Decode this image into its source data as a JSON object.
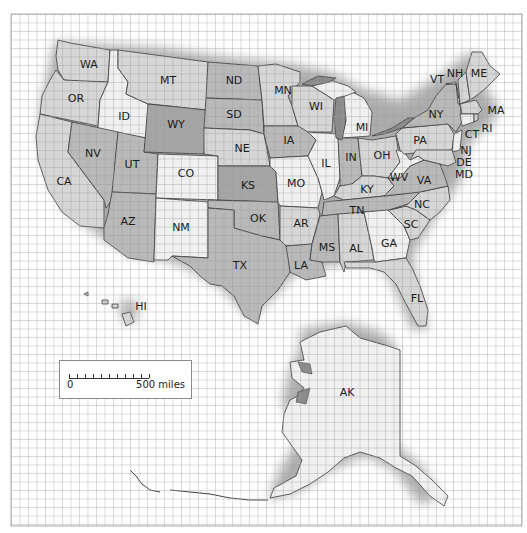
{
  "map": {
    "title": "United States",
    "grid": {
      "x0": 11,
      "y0": 14,
      "x1": 522,
      "y1": 526,
      "cell": 8.5,
      "color": "#9a9a9a"
    },
    "colors": {
      "background": "#ffffff",
      "shade_light": "#f0f0f0",
      "shade_mid": "#d6d6d6",
      "shade_dark": "#b9b9b9",
      "shade_darker": "#a5a5a5",
      "water": "#8a8a8a",
      "border": "#3a3a3a"
    },
    "states": [
      {
        "abbr": "WA",
        "x": 89,
        "y": 65,
        "shade": "shade_mid"
      },
      {
        "abbr": "OR",
        "x": 76,
        "y": 99,
        "shade": "shade_mid"
      },
      {
        "abbr": "CA",
        "x": 64,
        "y": 182,
        "shade": "shade_mid"
      },
      {
        "abbr": "ID",
        "x": 124,
        "y": 117,
        "shade": "shade_light"
      },
      {
        "abbr": "NV",
        "x": 93,
        "y": 154,
        "shade": "shade_dark"
      },
      {
        "abbr": "UT",
        "x": 132,
        "y": 165,
        "shade": "shade_dark"
      },
      {
        "abbr": "AZ",
        "x": 128,
        "y": 222,
        "shade": "shade_dark"
      },
      {
        "abbr": "MT",
        "x": 168,
        "y": 81,
        "shade": "shade_mid"
      },
      {
        "abbr": "WY",
        "x": 176,
        "y": 125,
        "shade": "shade_darker"
      },
      {
        "abbr": "CO",
        "x": 186,
        "y": 174,
        "shade": "shade_light"
      },
      {
        "abbr": "NM",
        "x": 181,
        "y": 228,
        "shade": "shade_light"
      },
      {
        "abbr": "ND",
        "x": 234,
        "y": 81,
        "shade": "shade_dark"
      },
      {
        "abbr": "SD",
        "x": 234,
        "y": 115,
        "shade": "shade_dark"
      },
      {
        "abbr": "NE",
        "x": 242,
        "y": 149,
        "shade": "shade_mid"
      },
      {
        "abbr": "KS",
        "x": 248,
        "y": 186,
        "shade": "shade_darker"
      },
      {
        "abbr": "OK",
        "x": 258,
        "y": 219,
        "shade": "shade_dark"
      },
      {
        "abbr": "TX",
        "x": 240,
        "y": 266,
        "shade": "shade_dark"
      },
      {
        "abbr": "MN",
        "x": 283,
        "y": 91,
        "shade": "shade_mid"
      },
      {
        "abbr": "IA",
        "x": 289,
        "y": 141,
        "shade": "shade_dark"
      },
      {
        "abbr": "MO",
        "x": 296,
        "y": 184,
        "shade": "shade_light"
      },
      {
        "abbr": "AR",
        "x": 301,
        "y": 224,
        "shade": "shade_mid"
      },
      {
        "abbr": "LA",
        "x": 301,
        "y": 266,
        "shade": "shade_dark"
      },
      {
        "abbr": "WI",
        "x": 316,
        "y": 107,
        "shade": "shade_mid"
      },
      {
        "abbr": "IL",
        "x": 326,
        "y": 164,
        "shade": "shade_light"
      },
      {
        "abbr": "MI",
        "x": 362,
        "y": 128,
        "shade": "shade_light"
      },
      {
        "abbr": "IN",
        "x": 351,
        "y": 158,
        "shade": "shade_dark"
      },
      {
        "abbr": "OH",
        "x": 382,
        "y": 156,
        "shade": "shade_mid"
      },
      {
        "abbr": "KY",
        "x": 367,
        "y": 190,
        "shade": "shade_mid"
      },
      {
        "abbr": "TN",
        "x": 357,
        "y": 211,
        "shade": "shade_dark"
      },
      {
        "abbr": "MS",
        "x": 327,
        "y": 248,
        "shade": "shade_dark"
      },
      {
        "abbr": "AL",
        "x": 356,
        "y": 249,
        "shade": "shade_mid"
      },
      {
        "abbr": "GA",
        "x": 389,
        "y": 244,
        "shade": "shade_light"
      },
      {
        "abbr": "FL",
        "x": 417,
        "y": 299,
        "shade": "shade_mid"
      },
      {
        "abbr": "SC",
        "x": 411,
        "y": 225,
        "shade": "shade_mid"
      },
      {
        "abbr": "NC",
        "x": 422,
        "y": 205,
        "shade": "shade_mid"
      },
      {
        "abbr": "VA",
        "x": 424,
        "y": 181,
        "shade": "shade_dark"
      },
      {
        "abbr": "WV",
        "x": 399,
        "y": 178,
        "shade": "shade_light"
      },
      {
        "abbr": "PA",
        "x": 420,
        "y": 141,
        "shade": "shade_mid"
      },
      {
        "abbr": "NY",
        "x": 436,
        "y": 115,
        "shade": "shade_dark"
      },
      {
        "abbr": "VT",
        "x": 437,
        "y": 80,
        "shade": "shade_mid"
      },
      {
        "abbr": "NH",
        "x": 455,
        "y": 74,
        "shade": "shade_mid"
      },
      {
        "abbr": "ME",
        "x": 479,
        "y": 74,
        "shade": "shade_mid"
      },
      {
        "abbr": "MA",
        "x": 496,
        "y": 111,
        "shade": "shade_mid"
      },
      {
        "abbr": "RI",
        "x": 487,
        "y": 129,
        "shade": "shade_mid"
      },
      {
        "abbr": "CT",
        "x": 472,
        "y": 135,
        "shade": "shade_mid"
      },
      {
        "abbr": "NJ",
        "x": 466,
        "y": 151,
        "shade": "shade_mid"
      },
      {
        "abbr": "DE",
        "x": 464,
        "y": 163,
        "shade": "shade_mid"
      },
      {
        "abbr": "MD",
        "x": 464,
        "y": 175,
        "shade": "shade_mid"
      },
      {
        "abbr": "HI",
        "x": 141,
        "y": 307,
        "shade": "shade_mid"
      },
      {
        "abbr": "AK",
        "x": 347,
        "y": 393,
        "shade": "shade_light"
      }
    ],
    "scale": {
      "zero_label": "0",
      "max_label": "500 miles",
      "ticks": 11
    }
  }
}
